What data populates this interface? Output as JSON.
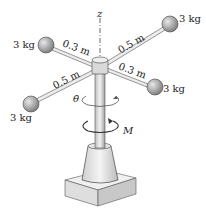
{
  "diagram": {
    "axis_label": "z",
    "masses": [
      {
        "position": "upper-right",
        "label": "3 kg"
      },
      {
        "position": "upper-left",
        "label": "3 kg"
      },
      {
        "position": "right",
        "label": "3 kg"
      },
      {
        "position": "lower-left",
        "label": "3 kg"
      }
    ],
    "arm_lengths": [
      {
        "position": "upper-left-arm",
        "label": "0.3 m"
      },
      {
        "position": "upper-right-arm",
        "label": "0.5 m"
      },
      {
        "position": "lower-left-arm",
        "label": "0.5 m"
      },
      {
        "position": "right-arm",
        "label": "0.3 m"
      }
    ],
    "angular_rate_label": "θ̇",
    "moment_label": "M",
    "colors": {
      "ball": "#9a9a9a",
      "shaft": "#d8d8d8",
      "base": "#e4e4e4",
      "outline": "#333333"
    }
  }
}
